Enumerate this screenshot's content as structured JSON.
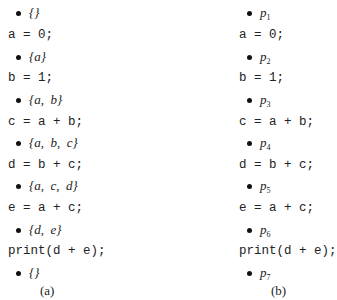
{
  "panel_a": {
    "caption": "(a)",
    "rows": [
      {
        "kind": "set",
        "text": "{}"
      },
      {
        "kind": "code",
        "text": "a = 0;"
      },
      {
        "kind": "set",
        "text": "{a}"
      },
      {
        "kind": "code",
        "text": "b = 1;"
      },
      {
        "kind": "set",
        "text": "{a, b}"
      },
      {
        "kind": "code",
        "text": "c = a + b;"
      },
      {
        "kind": "set",
        "text": "{a, b, c}"
      },
      {
        "kind": "code",
        "text": "d = b + c;"
      },
      {
        "kind": "set",
        "text": "{a, c, d}"
      },
      {
        "kind": "code",
        "text": "e = a + c;"
      },
      {
        "kind": "set",
        "text": "{d, e}"
      },
      {
        "kind": "code",
        "text": "print(d + e);"
      },
      {
        "kind": "set",
        "text": "{}"
      }
    ]
  },
  "panel_b": {
    "caption": "(b)",
    "rows": [
      {
        "kind": "point",
        "base": "p",
        "sub": "1"
      },
      {
        "kind": "code",
        "text": "a = 0;"
      },
      {
        "kind": "point",
        "base": "p",
        "sub": "2"
      },
      {
        "kind": "code",
        "text": "b = 1;"
      },
      {
        "kind": "point",
        "base": "p",
        "sub": "3"
      },
      {
        "kind": "code",
        "text": "c = a + b;"
      },
      {
        "kind": "point",
        "base": "p",
        "sub": "4"
      },
      {
        "kind": "code",
        "text": "d = b + c;"
      },
      {
        "kind": "point",
        "base": "p",
        "sub": "5"
      },
      {
        "kind": "code",
        "text": "e = a + c;"
      },
      {
        "kind": "point",
        "base": "p",
        "sub": "6"
      },
      {
        "kind": "code",
        "text": "print(d + e);"
      },
      {
        "kind": "point",
        "base": "p",
        "sub": "7"
      }
    ]
  }
}
